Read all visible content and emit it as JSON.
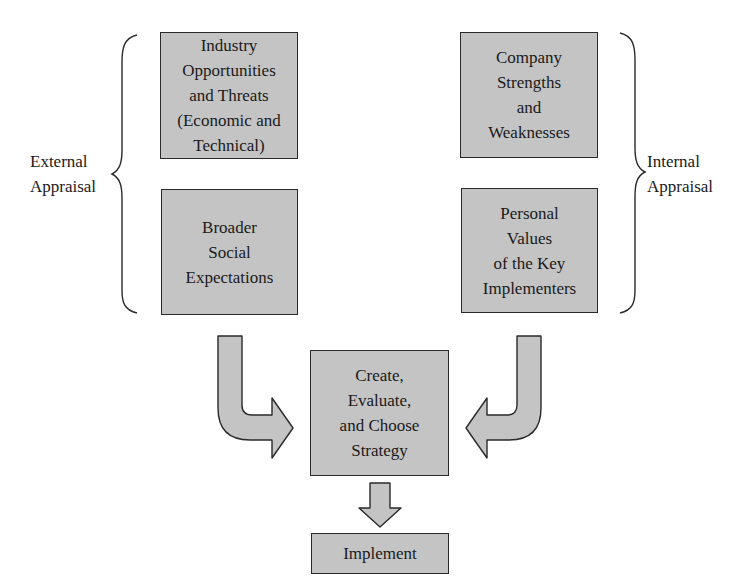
{
  "diagram": {
    "external_appraisal": {
      "label_lines": [
        "External",
        "Appraisal"
      ],
      "boxes": [
        {
          "lines": [
            "Industry",
            "Opportunities",
            "and Threats",
            "(Economic and",
            "Technical)"
          ]
        },
        {
          "lines": [
            "Broader",
            "Social",
            "Expectations"
          ]
        }
      ]
    },
    "internal_appraisal": {
      "label_lines": [
        "Internal",
        "Appraisal"
      ],
      "boxes": [
        {
          "lines": [
            "Company",
            "Strengths",
            "and",
            "Weaknesses"
          ]
        },
        {
          "lines": [
            "Personal",
            "Values",
            "of the Key",
            "Implementers"
          ]
        }
      ]
    },
    "strategy_box": {
      "lines": [
        "Create,",
        "Evaluate,",
        "and Choose",
        "Strategy"
      ]
    },
    "implement_box": {
      "lines": [
        "Implement"
      ]
    },
    "colors": {
      "box_fill": "#c4c4c4",
      "stroke": "#2a2a2a",
      "background": "#ffffff"
    }
  }
}
